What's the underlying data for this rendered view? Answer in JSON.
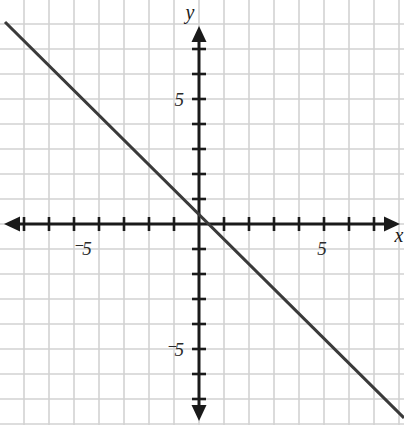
{
  "chart_data": {
    "type": "line",
    "title": "",
    "xlabel": "x",
    "ylabel": "y",
    "xlim": [
      -8,
      8.2
    ],
    "ylim": [
      -8.04,
      8.96
    ],
    "grid": true,
    "grid_spacing": 1,
    "legend": "none",
    "equation": "y = -x",
    "slope": -1,
    "y_intercept": 0,
    "series": [
      {
        "name": "y = -x",
        "color": "#3a3a3a",
        "x": [
          -7.76,
          8.2
        ],
        "values": [
          8.08,
          -7.76
        ],
        "points": [
          {
            "x": -7.76,
            "y": 8.08
          },
          {
            "x": -4,
            "y": 4
          },
          {
            "x": 0,
            "y": 0
          },
          {
            "x": 4,
            "y": -4
          },
          {
            "x": 8.2,
            "y": -7.76
          }
        ]
      }
    ],
    "x_ticks": [
      -8,
      -7,
      -6,
      -5,
      -4,
      -3,
      -2,
      -1,
      1,
      2,
      3,
      4,
      5,
      6,
      7,
      8
    ],
    "y_ticks": [
      -8,
      -7,
      -6,
      -5,
      -4,
      -3,
      -2,
      -1,
      1,
      2,
      3,
      4,
      5,
      6,
      7
    ],
    "x_tick_labels": [
      {
        "value": -5,
        "text": "⁻5"
      },
      {
        "value": 5,
        "text": "5"
      }
    ],
    "y_tick_labels": [
      {
        "value": 5,
        "text": "5"
      },
      {
        "value": -5,
        "text": "⁻5"
      }
    ]
  },
  "axes": {
    "x_axis_label": "x",
    "y_axis_label": "y",
    "axis_color": "#1a1a1a",
    "grid_color": "#d2d2d2",
    "line_color": "#3a3a3a",
    "background_color": "#ffffff"
  },
  "labels": {
    "x_neg_five": "⁻5",
    "x_pos_five": "5",
    "y_pos_five": "5",
    "y_neg_five": "⁻5"
  },
  "geometry": {
    "origin_x": 199,
    "origin_y": 224,
    "unit_px": 25,
    "width": 404,
    "height": 425
  }
}
